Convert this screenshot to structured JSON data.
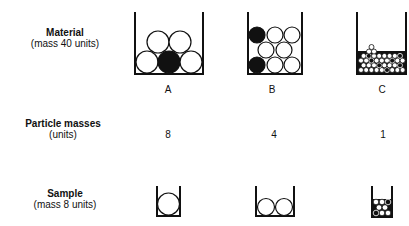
{
  "rows": {
    "material": {
      "title": "Material",
      "subtitle": "(mass 40 units)"
    },
    "particle_masses": {
      "title": "Particle masses",
      "subtitle": "(units)"
    },
    "sample": {
      "title": "Sample",
      "subtitle": "(mass 8 units)"
    }
  },
  "columns": [
    {
      "label": "A",
      "particle_mass": "8",
      "material_particles": 5,
      "material_black": 1,
      "sample_particles": 1
    },
    {
      "label": "B",
      "particle_mass": "4",
      "material_particles": 8,
      "material_black": 2,
      "sample_particles": 2
    },
    {
      "label": "C",
      "particle_mass": "1",
      "material_particles": 40,
      "sample_particles": 8
    }
  ],
  "colors": {
    "ink": "#111111",
    "fill_white": "#ffffff",
    "fill_black": "#111111"
  }
}
